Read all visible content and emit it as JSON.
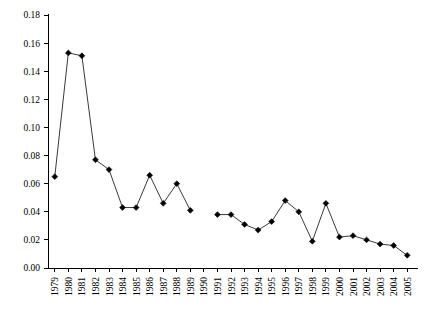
{
  "chart_data": {
    "type": "line",
    "title": "",
    "subtitle": "",
    "xlabel": "",
    "ylabel": "",
    "grid": false,
    "legend": false,
    "legend_position": "none",
    "marker": "diamond",
    "line_color": "#3a3a3a",
    "marker_color": "#000000",
    "xlim": [
      1979,
      2005
    ],
    "ylim": [
      0.0,
      0.18
    ],
    "ytick_step": 0.02,
    "categories": [
      "1979",
      "1980",
      "1981",
      "1982",
      "1983",
      "1984",
      "1985",
      "1986",
      "1987",
      "1988",
      "1989",
      "1990",
      "1991",
      "1992",
      "1993",
      "1994",
      "1995",
      "1996",
      "1997",
      "1998",
      "1999",
      "2000",
      "2001",
      "2002",
      "2003",
      "2004",
      "2005"
    ],
    "ytick_labels": [
      "0.00",
      "0.02",
      "0.04",
      "0.06",
      "0.08",
      "0.10",
      "0.12",
      "0.14",
      "0.16",
      "0.18"
    ],
    "ytick_values": [
      0.0,
      0.02,
      0.04,
      0.06,
      0.08,
      0.1,
      0.12,
      0.14,
      0.16,
      0.18
    ],
    "x": [
      1979,
      1980,
      1981,
      1982,
      1983,
      1984,
      1985,
      1986,
      1987,
      1988,
      1989,
      1990,
      1991,
      1992,
      1993,
      1994,
      1995,
      1996,
      1997,
      1998,
      1999,
      2000,
      2001,
      2002,
      2003,
      2004,
      2005
    ],
    "values": [
      0.065,
      0.153,
      0.151,
      0.077,
      0.07,
      0.043,
      0.043,
      0.066,
      0.046,
      0.06,
      0.041,
      null,
      0.038,
      0.038,
      0.031,
      0.027,
      0.033,
      0.048,
      0.04,
      0.019,
      0.046,
      0.022,
      0.023,
      0.02,
      0.017,
      0.016,
      0.009
    ],
    "missing_categories": [
      "1990"
    ],
    "series": [
      {
        "name": "series-1",
        "values": [
          0.065,
          0.153,
          0.151,
          0.077,
          0.07,
          0.043,
          0.043,
          0.066,
          0.046,
          0.06,
          0.041,
          null,
          0.038,
          0.038,
          0.031,
          0.027,
          0.033,
          0.048,
          0.04,
          0.019,
          0.046,
          0.022,
          0.023,
          0.02,
          0.017,
          0.016,
          0.009
        ]
      }
    ]
  }
}
